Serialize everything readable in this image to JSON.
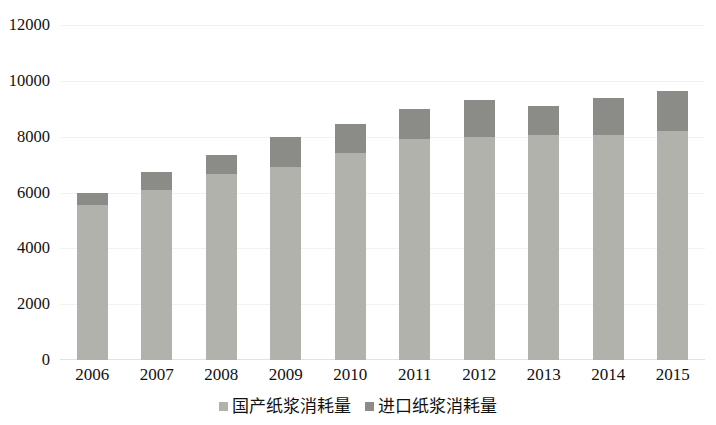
{
  "chart_data": {
    "type": "bar",
    "subtype": "stacked-column",
    "title": "",
    "xlabel": "",
    "ylabel": "",
    "ylim": [
      0,
      12000
    ],
    "ytick_step": 2000,
    "yticks": [
      "0",
      "2000",
      "4000",
      "6000",
      "8000",
      "10000",
      "12000"
    ],
    "grid": true,
    "legend_position": "bottom",
    "categories": [
      "2006",
      "2007",
      "2008",
      "2009",
      "2010",
      "2011",
      "2012",
      "2013",
      "2014",
      "2015"
    ],
    "series": [
      {
        "name": "国产纸浆消耗量",
        "color": "#b2b2ad",
        "values": [
          5550,
          6100,
          6650,
          6900,
          7400,
          7900,
          8000,
          8050,
          8050,
          8200
        ]
      },
      {
        "name": "进口纸浆消耗量",
        "color": "#8b8b88",
        "values": [
          450,
          650,
          700,
          1100,
          1050,
          1100,
          1300,
          1050,
          1350,
          1450
        ]
      }
    ],
    "totals": [
      6000,
      6750,
      7350,
      8000,
      8450,
      9000,
      9300,
      9100,
      9400,
      9650
    ]
  },
  "legend": {
    "items": [
      {
        "label": "国产纸浆消耗量",
        "color": "#b2b2ad",
        "key": "domestic"
      },
      {
        "label": "进口纸浆消耗量",
        "color": "#8b8b88",
        "key": "import"
      }
    ]
  },
  "colors": {
    "domestic": "#b2b2ad",
    "import": "#8b8b88",
    "grid": "#f2f2f2",
    "text": "#111111",
    "background": "#ffffff"
  }
}
